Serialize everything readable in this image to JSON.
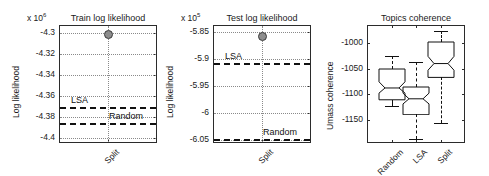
{
  "figure": {
    "background": "#ffffff",
    "axis_color": "#2b2b2b",
    "grid_color": "#8a8a8a",
    "ref_line_color": "#111111",
    "marker_color": "#8d8d8d"
  },
  "chart_data": [
    {
      "type": "scatter",
      "title": "Train log likelihood",
      "exponent_label_prefix": "x 10",
      "exponent_label_power": "6",
      "xlabel": "",
      "ylabel": "Log likelihood",
      "categories": [
        "Split"
      ],
      "xtick_labels": [
        "Split"
      ],
      "ytick_labels": [
        "-4.3",
        "-4.32",
        "-4.34",
        "-4.36",
        "-4.38",
        "-4.4"
      ],
      "ytick_values": [
        -4.3,
        -4.32,
        -4.34,
        -4.36,
        -4.38,
        -4.4
      ],
      "ylim": [
        -4.405,
        -4.292
      ],
      "grid": true,
      "series": [
        {
          "name": "Split",
          "marker": "filled-circle",
          "x": [
            "Split"
          ],
          "values": [
            -4.301
          ]
        }
      ],
      "reference_lines": [
        {
          "name": "LSA",
          "label": "LSA",
          "value": -4.3705,
          "style": "dashed"
        },
        {
          "name": "Random",
          "label": "Random",
          "value": -4.3855,
          "style": "dashed"
        }
      ]
    },
    {
      "type": "scatter",
      "title": "Test log likelihood",
      "exponent_label_prefix": "x 10",
      "exponent_label_power": "5",
      "xlabel": "",
      "ylabel": "Log likelihood",
      "categories": [
        "Split"
      ],
      "xtick_labels": [
        "Split"
      ],
      "ytick_labels": [
        "-5.85",
        "-5.9",
        "-5.95",
        "-6",
        "-6.05"
      ],
      "ytick_values": [
        -5.85,
        -5.9,
        -5.95,
        -6.0,
        -6.05
      ],
      "ylim": [
        -6.056,
        -5.837
      ],
      "grid": true,
      "series": [
        {
          "name": "Split",
          "marker": "filled-circle",
          "x": [
            "Split"
          ],
          "values": [
            -5.858
          ]
        }
      ],
      "reference_lines": [
        {
          "name": "LSA",
          "label": "LSA",
          "value": -5.908,
          "style": "dashed"
        },
        {
          "name": "Random",
          "label": "Random",
          "value": -6.048,
          "style": "dashed"
        }
      ]
    },
    {
      "type": "boxplot",
      "title": "Topics coherence",
      "xlabel": "",
      "ylabel": "Umass coherence",
      "categories": [
        "Random",
        "LSA",
        "Split"
      ],
      "xtick_labels": [
        "Random",
        "LSA",
        "Split"
      ],
      "ytick_labels": [
        "-1000",
        "-1050",
        "-1100",
        "-1150"
      ],
      "ytick_values": [
        -1000,
        -1050,
        -1100,
        -1150
      ],
      "ylim": [
        -1195,
        -965
      ],
      "grid": false,
      "notched": true,
      "boxes": [
        {
          "name": "Random",
          "whisker_low": -1122,
          "q1": -1111,
          "median": -1088,
          "q3": -1051,
          "whisker_high": -1026,
          "notch_low": -1098,
          "notch_high": -1076
        },
        {
          "name": "LSA",
          "whisker_low": -1188,
          "q1": -1139,
          "median": -1108,
          "q3": -1085,
          "whisker_high": -1038,
          "notch_low": -1118,
          "notch_high": -1097
        },
        {
          "name": "Split",
          "whisker_low": -1156,
          "q1": -1067,
          "median": -1040,
          "q3": -998,
          "whisker_high": -977,
          "notch_low": -1053,
          "notch_high": -1026
        }
      ]
    }
  ]
}
